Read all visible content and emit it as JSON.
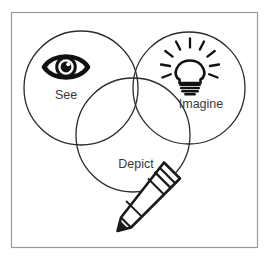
{
  "figure": {
    "type": "venn-diagram",
    "title_visible": false,
    "frame": {
      "stroke_color": "#9a9a9a",
      "fill_color": "#ffffff",
      "x": 11,
      "y": 12,
      "width": 247,
      "height": 236
    },
    "background_color": "#ffffff",
    "circle_stroke_color": "#2b2b2b",
    "circle_fill": "none",
    "label_color": "#3a3a3c",
    "icon_color": "#1a1a1a"
  },
  "circles": [
    {
      "id": "see",
      "label": "See",
      "icon": "eye-icon",
      "cx": 81,
      "cy": 88,
      "r": 57,
      "label_x": 66,
      "label_y": 96
    },
    {
      "id": "imagine",
      "label": "Imagine",
      "icon": "lightbulb-icon",
      "cx": 189,
      "cy": 88,
      "r": 56,
      "label_x": 201,
      "label_y": 105
    },
    {
      "id": "depict",
      "label": "Depict",
      "icon": "pencil-icon",
      "cx": 133,
      "cy": 135,
      "r": 57,
      "label_x": 136,
      "label_y": 165
    }
  ],
  "icons": {
    "eye": {
      "name": "eye-icon",
      "cx": 66,
      "cy": 67,
      "width": 44,
      "height": 23,
      "description": "open eye with iris and pupil highlight"
    },
    "lightbulb": {
      "name": "lightbulb-icon",
      "cx": 190,
      "cy": 66,
      "rays": 7,
      "base_lines": 4,
      "description": "glowing light bulb with radiating rays and screw base"
    },
    "pencil": {
      "name": "pencil-icon",
      "tip_x": 121,
      "tip_y": 222,
      "eraser_x": 173,
      "eraser_y": 171,
      "description": "pencil angled diagonally pointing down-left"
    }
  }
}
